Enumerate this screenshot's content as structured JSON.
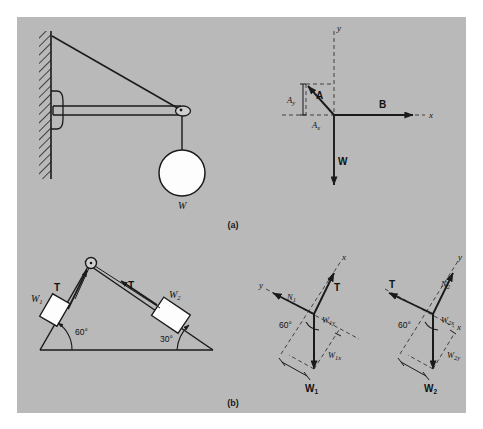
{
  "figure": {
    "captions": {
      "a": "(a)",
      "b": "(b)"
    },
    "background_color": "#b9b9b9",
    "ink_color": "#1a1a1a"
  },
  "panel_a": {
    "bracket": {
      "name": "wall-bracket-with-hanging-weight",
      "weight_label": "W"
    },
    "vector_diagram": {
      "axis_x_label": "x",
      "axis_y_label": "y",
      "vectors": [
        {
          "name": "A",
          "label": "A",
          "direction": "up-left"
        },
        {
          "name": "B",
          "label": "B",
          "direction": "right"
        },
        {
          "name": "W",
          "label": "W",
          "direction": "down"
        }
      ],
      "components": [
        {
          "name": "Ay",
          "base": "A",
          "sub": "y"
        },
        {
          "name": "Ax",
          "base": "A",
          "sub": "x"
        }
      ]
    }
  },
  "panel_b": {
    "incline": {
      "name": "double-incline-with-pulley",
      "left_angle": "60°",
      "right_angle": "30°",
      "block_left_label": "W",
      "block_left_sub": "1",
      "block_right_label": "W",
      "block_right_sub": "2",
      "tension_left_label": "T",
      "tension_right_label": "T"
    },
    "fbd_left": {
      "name": "free-body-diagram-w1",
      "angle": "60°",
      "axis_x_label": "x",
      "axis_y_label": "y",
      "normal_label": "N",
      "normal_sub": "1",
      "tension_label": "T",
      "weight_label": "W",
      "weight_sub": "1",
      "comp_upper_base": "W",
      "comp_upper_sub": "1y",
      "comp_lower_base": "W",
      "comp_lower_sub": "1x"
    },
    "fbd_right": {
      "name": "free-body-diagram-w2",
      "angle": "60°",
      "axis_x_label": "x",
      "axis_y_label": "y",
      "normal_label": "N",
      "normal_sub": "2",
      "tension_label": "T",
      "weight_label": "W",
      "weight_sub": "2",
      "comp_upper_base": "W",
      "comp_upper_sub": "2x",
      "comp_lower_base": "W",
      "comp_lower_sub": "2y"
    }
  }
}
